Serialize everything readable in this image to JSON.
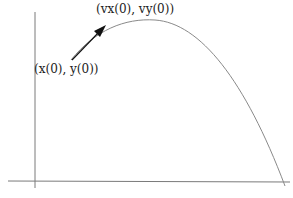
{
  "diagram": {
    "type": "projectile-trajectory",
    "labels": {
      "initial_position": "(x(0), y(0))",
      "initial_velocity": "(vx(0), vy(0))"
    },
    "caption": "Figure (partially visible)",
    "colors": {
      "axes": "#7a7a7a",
      "curve": "#8a8a8a",
      "arrow": "#111111",
      "text": "#222222"
    },
    "axes": {
      "vertical_x": 35,
      "horizontal_y": 181
    },
    "curve": {
      "start": [
        71,
        60
      ],
      "peak": [
        150,
        20
      ],
      "end": [
        285,
        185
      ]
    },
    "arrow": {
      "from": [
        72,
        60
      ],
      "to": [
        103,
        28
      ]
    }
  }
}
